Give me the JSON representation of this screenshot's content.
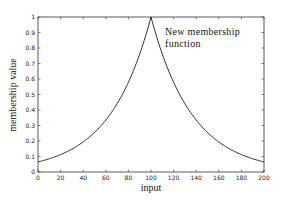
{
  "chart_data": {
    "type": "line",
    "title": "",
    "xlabel": "input",
    "ylabel": "membership value",
    "xlim": [
      0,
      200
    ],
    "ylim": [
      0,
      1
    ],
    "grid": false,
    "legend": null,
    "x_ticks": [
      0,
      20,
      40,
      60,
      80,
      100,
      120,
      140,
      160,
      180,
      200
    ],
    "y_ticks": [
      0,
      0.1,
      0.2,
      0.3,
      0.4,
      0.5,
      0.6,
      0.7,
      0.8,
      0.9,
      1
    ],
    "annotations": [
      {
        "text_line1": "New  membership",
        "text_line2": "function",
        "x": 110,
        "y": 0.88
      }
    ],
    "series": [
      {
        "name": "New membership function",
        "x": [
          0,
          10,
          20,
          30,
          40,
          50,
          60,
          70,
          80,
          90,
          100,
          110,
          120,
          130,
          140,
          150,
          160,
          170,
          180,
          190,
          200
        ],
        "y": [
          0.065,
          0.085,
          0.112,
          0.148,
          0.194,
          0.255,
          0.336,
          0.441,
          0.579,
          0.761,
          1.0,
          0.761,
          0.579,
          0.441,
          0.336,
          0.255,
          0.194,
          0.148,
          0.112,
          0.085,
          0.065
        ]
      }
    ]
  },
  "labels": {
    "xlabel": "input",
    "ylabel": "membership value",
    "annot_line1": "New  membership",
    "annot_line2": "function"
  }
}
